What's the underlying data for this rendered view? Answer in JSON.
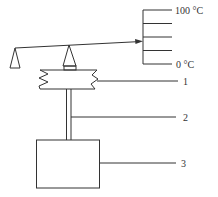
{
  "diagram": {
    "type": "thermometer-mechanism",
    "scale": {
      "top_label": "100 °C",
      "bottom_label": "0 °C",
      "tick_count": 5
    },
    "callouts": [
      {
        "number": "1",
        "target": "bellows"
      },
      {
        "number": "2",
        "target": "capillary-tube"
      },
      {
        "number": "3",
        "target": "bulb-box"
      }
    ],
    "colors": {
      "line": "#333333",
      "background": "#ffffff"
    }
  }
}
